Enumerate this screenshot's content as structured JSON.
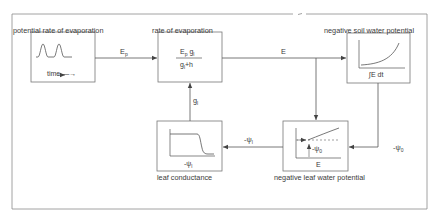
{
  "diagram": {
    "type": "feedback-loop block diagram",
    "blocks": [
      {
        "id": "potential-evaporation",
        "title": "potential rate of evaporation",
        "inner_axis_label": "time —→",
        "graph": "two-peaked periodic curve over time"
      },
      {
        "id": "rate-of-evaporation",
        "title": "rate of evaporation",
        "formula_numerator": "E",
        "formula_numerator_sub": "p",
        "formula_numerator_tail": " g",
        "formula_numerator_tail_sub": "l",
        "formula_denominator": "g",
        "formula_denominator_sub": "l",
        "formula_denominator_tail": "+h"
      },
      {
        "id": "soil-water-potential",
        "title": "negative soil water potential",
        "inner_axis_label": "∫E dt",
        "graph": "increasing convex curve"
      },
      {
        "id": "leaf-water-potential",
        "title": "negative leaf water potential",
        "inner_axis_label": "E",
        "inner_annotation": "-ψ",
        "inner_annotation_sub": "0",
        "graph": "rising line above dashed baseline with offset arrow"
      },
      {
        "id": "leaf-conductance",
        "title": "leaf conductance",
        "inner_axis_label": "-ψ",
        "inner_axis_label_sub": "l",
        "graph": "sigmoid step-down curve"
      }
    ],
    "connections": [
      {
        "from": "potential-evaporation",
        "to": "rate-of-evaporation",
        "label": "E",
        "label_sub": "p"
      },
      {
        "from": "rate-of-evaporation",
        "to": "soil-water-potential",
        "label": "E"
      },
      {
        "from": "rate-of-evaporation",
        "to": "leaf-water-potential",
        "label": ""
      },
      {
        "from": "soil-water-potential",
        "to": "leaf-water-potential",
        "label": "-ψ",
        "label_sub": "0"
      },
      {
        "from": "leaf-water-potential",
        "to": "leaf-conductance",
        "label": "-ψ",
        "label_sub": "l"
      },
      {
        "from": "leaf-conductance",
        "to": "rate-of-evaporation",
        "label": "g",
        "label_sub": "l"
      }
    ],
    "colors": {
      "line": "#5a5a5a",
      "frame": "#8a8a8a",
      "text": "#3a3a3a",
      "background": "#ffffff"
    }
  }
}
